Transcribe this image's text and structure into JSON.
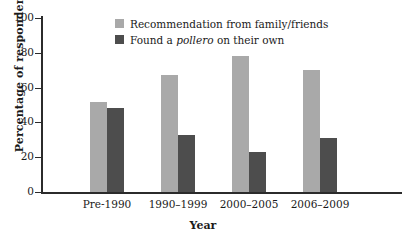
{
  "chart_data": {
    "type": "bar",
    "title": "",
    "xlabel": "Year",
    "ylabel": "Percentage of respondents",
    "ylim": [
      0,
      100
    ],
    "yticks": [
      0,
      20,
      40,
      60,
      80,
      100
    ],
    "grid": false,
    "legend_position": "top-center",
    "categories": [
      "Pre-1990",
      "1990–1999",
      "2000–2005",
      "2006–2009"
    ],
    "series": [
      {
        "name": "Recommendation from family/friends",
        "color": "#a9a9a9",
        "values": [
          52,
          67,
          78,
          70
        ]
      },
      {
        "name": "Found a pollero on their own",
        "color": "#4d4d4d",
        "values": [
          48,
          33,
          23,
          31
        ]
      }
    ]
  },
  "legend": {
    "items": [
      {
        "label_pre": "Recommendation from family/friends",
        "label_italic": "",
        "label_post": ""
      },
      {
        "label_pre": "Found a ",
        "label_italic": "pollero",
        "label_post": " on their own"
      }
    ]
  },
  "axis": {
    "y_tick_labels": [
      "0",
      "20",
      "40",
      "60",
      "80",
      "100"
    ],
    "y_title": "Percentage of respondents",
    "x_title": "Year"
  },
  "colors": {
    "series_light": "#a9a9a9",
    "series_dark": "#4d4d4d",
    "axis": "#2b2b2b",
    "background": "#ffffff"
  }
}
